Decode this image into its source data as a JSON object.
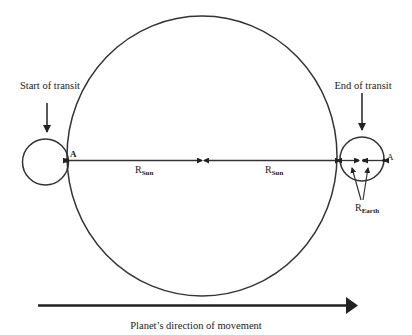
{
  "labels": {
    "start": "Start of transit",
    "end": "End of transit",
    "point_a_left": "A",
    "point_a_right": "A",
    "r_sun_left": "R",
    "r_sun_left_sub": "Sun",
    "r_sun_right": "R",
    "r_sun_right_sub": "Sun",
    "r_earth": "R",
    "r_earth_sub": "Earth",
    "direction": "Planet’s direction of movement"
  },
  "colors": {
    "stroke": "#222222",
    "background": "#ffffff"
  }
}
